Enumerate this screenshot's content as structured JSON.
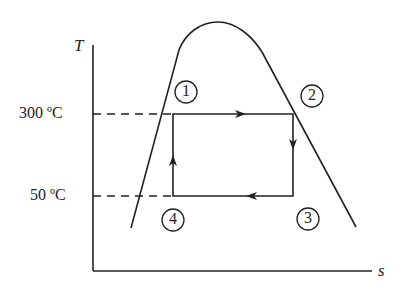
{
  "diagram": {
    "type": "T-s diagram (Rankine/Carnot cycle inside saturation dome)",
    "axes": {
      "y_label": "T",
      "x_label": "s"
    },
    "isotherms": [
      {
        "label": "300 ºC",
        "state_from": "1",
        "state_to": "2"
      },
      {
        "label": "50 ºC",
        "state_from": "4",
        "state_to": "3"
      }
    ],
    "states": [
      {
        "id": "1",
        "label": "1"
      },
      {
        "id": "2",
        "label": "2"
      },
      {
        "id": "3",
        "label": "3"
      },
      {
        "id": "4",
        "label": "4"
      }
    ],
    "processes": [
      {
        "from": "1",
        "to": "2",
        "direction": "right"
      },
      {
        "from": "2",
        "to": "3",
        "direction": "down"
      },
      {
        "from": "3",
        "to": "4",
        "direction": "left"
      },
      {
        "from": "4",
        "to": "1",
        "direction": "up"
      }
    ],
    "colors": {
      "line": "#222222",
      "background": "#ffffff"
    }
  }
}
